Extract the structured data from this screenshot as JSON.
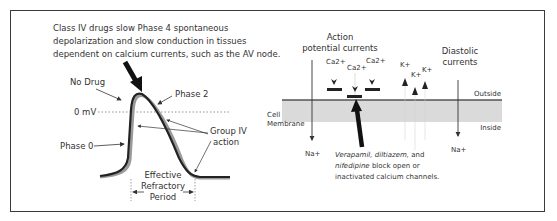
{
  "left_panel": {
    "caption_lines": [
      "Class IV drugs slow Phase 4 spontaneous",
      "depolarization and slow conduction in tissues",
      "dependent on calcium currents, such as the AV node."
    ],
    "labels": {
      "no_drug": "No Drug",
      "phase_2": "Phase 2",
      "zero_mv": "0 mV",
      "phase_0": "Phase 0",
      "group_iv_line1": "Group IV",
      "group_iv_line2": "action",
      "erp_line1": "Effective",
      "erp_line2": "Refractory",
      "erp_line3": "Period"
    }
  },
  "right_panel": {
    "action_potential_line1": "Action",
    "action_potential_line2": "potential currents",
    "diastolic_line1": "Diastolic",
    "diastolic_line2": "currents",
    "ca_labels": [
      "Ca2+",
      "Ca2+",
      "Ca2+"
    ],
    "k_labels": [
      "K+",
      "K+",
      "K+"
    ],
    "na_labels": [
      "Na+",
      "Na+"
    ],
    "outside": "Outside",
    "inside": "Inside",
    "membrane_line1": "Cell",
    "membrane_line2": "Membrane",
    "note_line1_italic": "Verapamil, diltiazem,",
    "note_line1_rest": " and",
    "note_line2_italic": "nifedipine",
    "note_line2_rest": " block open or",
    "note_line3": "inactivated calcium channels."
  },
  "colors": {
    "frame": "#3a3a3a",
    "membrane_band": "#d9d9d9",
    "no_drug_curve": "#222222",
    "drug_curve": "#9a9a9a"
  }
}
